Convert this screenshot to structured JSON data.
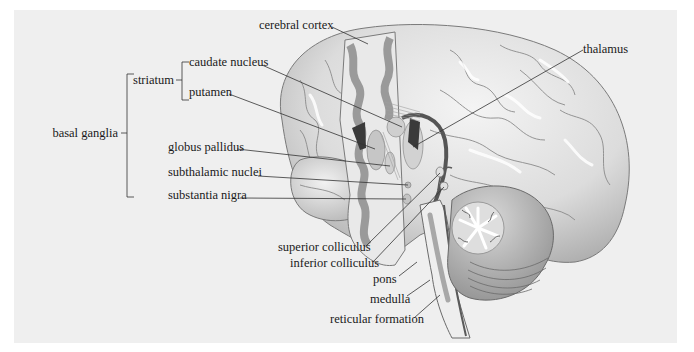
{
  "diagram": {
    "type": "anatomical-illustration",
    "colors": {
      "panel_background": "#efefef",
      "page_background": "#ffffff",
      "label_text": "#1a1a1a",
      "leader_line": "#333333",
      "cortex_surface": "#e4e4e4",
      "grey_matter": "#9a9a9a",
      "dark_structure": "#4a4a4a"
    },
    "groups": {
      "basal_ganglia": "basal ganglia",
      "striatum": "striatum"
    },
    "labels": {
      "cerebral_cortex": "cerebral cortex",
      "caudate_nucleus": "caudate nucleus",
      "putamen": "putamen",
      "thalamus": "thalamus",
      "globus_pallidus": "globus pallidus",
      "subthalamic_nuclei": "subthalamic nuclei",
      "substantia_nigra": "substantia nigra",
      "superior_colliculus": "superior colliculus",
      "inferior_colliculus": "inferior colliculus",
      "pons": "pons",
      "medulla": "medulla",
      "reticular_formation": "reticular formation"
    }
  }
}
